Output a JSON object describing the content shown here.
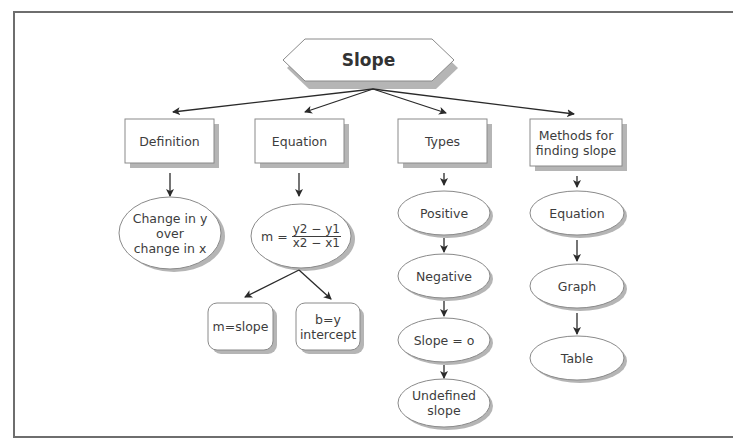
{
  "diagram": {
    "title": "Slope",
    "categories": [
      {
        "label": "Definition",
        "children": [
          "Change in y over change in x"
        ]
      },
      {
        "label": "Equation",
        "formula": {
          "lhs": "m =",
          "numerator": "y2 − y1",
          "denominator": "x2 − x1"
        },
        "children": [
          "m=slope",
          "b=y intercept"
        ]
      },
      {
        "label": "Types",
        "children": [
          "Positive",
          "Negative",
          "Slope = o",
          "Undefined slope"
        ]
      },
      {
        "label": "Methods for finding slope",
        "children": [
          "Equation",
          "Graph",
          "Table"
        ]
      }
    ]
  },
  "labels": {
    "title": "Slope",
    "definition": "Definition",
    "equation": "Equation",
    "types": "Types",
    "methods_line1": "Methods for",
    "methods_line2": "finding slope",
    "def_line1": "Change in y",
    "def_line2": "over",
    "def_line3": "change in x",
    "eq_lhs": "m =",
    "eq_num": "y2 − y1",
    "eq_den": "x2 − x1",
    "m_slope": "m=slope",
    "b_line1": "b=y",
    "b_line2": "intercept",
    "positive": "Positive",
    "negative": "Negative",
    "slope_zero": "Slope = o",
    "undef_line1": "Undefined",
    "undef_line2": "slope",
    "method_equation": "Equation",
    "method_graph": "Graph",
    "method_table": "Table"
  },
  "colors": {
    "stroke": "#7a7a7a",
    "shadow": "#b5b5b5",
    "arrow": "#2a2a2a",
    "frame": "#6e6e6e"
  }
}
